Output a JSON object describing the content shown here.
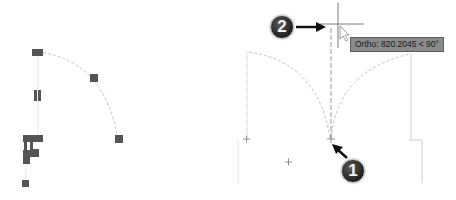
{
  "tooltip": {
    "mode": "Ortho",
    "text": "Ortho: 820.2045 < 90°",
    "distance": "820.2045",
    "angle": "90°"
  },
  "callouts": [
    {
      "number": "1",
      "meaning": "base point"
    },
    {
      "number": "2",
      "meaning": "cursor / second point"
    }
  ],
  "colors": {
    "grip": "#555555",
    "dashed_line": "#c4c4c4",
    "crosshair": "#7a7a7a",
    "tooltip_bg": "#8a8a8a",
    "badge": "#2a2a2a"
  }
}
